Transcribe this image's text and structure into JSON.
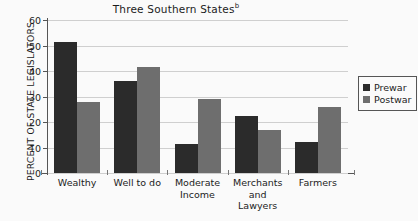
{
  "chart_data": {
    "type": "bar",
    "title": "Three Southern States",
    "title_superscript": "b",
    "xlabel": "",
    "ylabel": "PERCENT OF STATE LEGISLATORS",
    "ylim": [
      0,
      60
    ],
    "yticks": [
      0,
      10,
      20,
      30,
      40,
      50,
      60
    ],
    "ytick_labels": [
      "0",
      "10",
      "20",
      "30",
      "40",
      "50",
      "60"
    ],
    "grid": true,
    "legend_position": "right",
    "categories": [
      "Wealthy",
      "Well to do",
      "Moderate Income",
      "Merchants and Lawyers",
      "Farmers"
    ],
    "category_lines": [
      [
        "Wealthy"
      ],
      [
        "Well to do"
      ],
      [
        "Moderate",
        "Income"
      ],
      [
        "Merchants",
        "and",
        "Lawyers"
      ],
      [
        "Farmers"
      ]
    ],
    "series": [
      {
        "name": "Prewar",
        "color": "#2b2b2b",
        "values": [
          51.5,
          36,
          11.5,
          22.5,
          12
        ]
      },
      {
        "name": "Postwar",
        "color": "#6e6e6e",
        "values": [
          28,
          41.5,
          29,
          17,
          26
        ]
      }
    ]
  },
  "legend": {
    "items": [
      {
        "label": "Prewar",
        "swatch": "prewar-swatch"
      },
      {
        "label": "Postwar",
        "swatch": "postwar-swatch"
      }
    ]
  }
}
